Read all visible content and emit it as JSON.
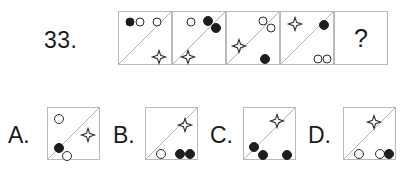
{
  "puzzle": {
    "question_number": "33.",
    "question_mark": "?",
    "type": "matrix-reasoning-sequence",
    "colors": {
      "box_border": "#b9b9b9",
      "diagonal": "#b0b0b0",
      "shape_outline": "#2b2b2b",
      "filled_shape": "#1d1d1d",
      "text": "#1a1a1a",
      "background": "#ffffff"
    },
    "sequence": {
      "box": {
        "left": 118,
        "top": 11,
        "size": 54,
        "count": 5
      },
      "cells": [
        {
          "name": "sequence-cell-1",
          "diagonal": "bottom-left-to-top-right",
          "shapes": [
            {
              "kind": "circle",
              "fill": "filled",
              "x": 11,
              "y": 10,
              "d": 9
            },
            {
              "kind": "circle",
              "fill": "open",
              "x": 21,
              "y": 10,
              "d": 9
            },
            {
              "kind": "circle",
              "fill": "open",
              "x": 38,
              "y": 10,
              "d": 9
            },
            {
              "kind": "star",
              "x": 40,
              "y": 45,
              "d": 13
            }
          ]
        },
        {
          "name": "sequence-cell-2",
          "diagonal": "bottom-left-to-top-right",
          "shapes": [
            {
              "kind": "circle",
              "fill": "open",
              "x": 18,
              "y": 10,
              "d": 9
            },
            {
              "kind": "circle",
              "fill": "filled",
              "x": 35,
              "y": 9,
              "d": 10
            },
            {
              "kind": "circle",
              "fill": "filled",
              "x": 43,
              "y": 16,
              "d": 10
            },
            {
              "kind": "star",
              "x": 15,
              "y": 45,
              "d": 13
            }
          ]
        },
        {
          "name": "sequence-cell-3",
          "diagonal": "bottom-left-to-top-right",
          "shapes": [
            {
              "kind": "circle",
              "fill": "open",
              "x": 36,
              "y": 9,
              "d": 9
            },
            {
              "kind": "circle",
              "fill": "open",
              "x": 44,
              "y": 16,
              "d": 9
            },
            {
              "kind": "star",
              "x": 12,
              "y": 34,
              "d": 13
            },
            {
              "kind": "circle",
              "fill": "filled",
              "x": 38,
              "y": 47,
              "d": 10
            }
          ]
        },
        {
          "name": "sequence-cell-4",
          "diagonal": "bottom-left-to-top-right",
          "shapes": [
            {
              "kind": "star",
              "x": 14,
              "y": 12,
              "d": 13
            },
            {
              "kind": "circle",
              "fill": "filled",
              "x": 43,
              "y": 13,
              "d": 10
            },
            {
              "kind": "circle",
              "fill": "open",
              "x": 37,
              "y": 47,
              "d": 9
            },
            {
              "kind": "circle",
              "fill": "open",
              "x": 46,
              "y": 47,
              "d": 9
            }
          ]
        },
        {
          "name": "sequence-cell-answer",
          "diagonal": "none",
          "is_answer_slot": true,
          "shapes": []
        }
      ]
    },
    "options": {
      "box": {
        "top": 107,
        "size": 53
      },
      "items": [
        {
          "name": "option-a",
          "label": "A.",
          "label_x": 8,
          "label_y": 124,
          "box_left": 47,
          "diagonal": "bottom-left-to-top-right",
          "shapes": [
            {
              "kind": "circle",
              "fill": "open",
              "x": 11,
              "y": 11,
              "d": 10
            },
            {
              "kind": "star",
              "x": 40,
              "y": 27,
              "d": 13
            },
            {
              "kind": "circle",
              "fill": "filled",
              "x": 11,
              "y": 40,
              "d": 10
            },
            {
              "kind": "circle",
              "fill": "open",
              "x": 19,
              "y": 48,
              "d": 10
            }
          ]
        },
        {
          "name": "option-b",
          "label": "B.",
          "label_x": 113,
          "label_y": 124,
          "box_left": 145,
          "diagonal": "bottom-left-to-top-right",
          "shapes": [
            {
              "kind": "star",
              "x": 39,
              "y": 17,
              "d": 13
            },
            {
              "kind": "circle",
              "fill": "open",
              "x": 15,
              "y": 46,
              "d": 10
            },
            {
              "kind": "circle",
              "fill": "filled",
              "x": 34,
              "y": 46,
              "d": 10
            },
            {
              "kind": "circle",
              "fill": "filled",
              "x": 44,
              "y": 46,
              "d": 10
            }
          ]
        },
        {
          "name": "option-c",
          "label": "C.",
          "label_x": 210,
          "label_y": 124,
          "box_left": 243,
          "diagonal": "bottom-left-to-top-right",
          "shapes": [
            {
              "kind": "star",
              "x": 33,
              "y": 13,
              "d": 13
            },
            {
              "kind": "circle",
              "fill": "filled",
              "x": 10,
              "y": 39,
              "d": 10
            },
            {
              "kind": "circle",
              "fill": "filled",
              "x": 19,
              "y": 47,
              "d": 10
            },
            {
              "kind": "circle",
              "fill": "filled",
              "x": 43,
              "y": 47,
              "d": 10
            }
          ]
        },
        {
          "name": "option-d",
          "label": "D.",
          "label_x": 308,
          "label_y": 124,
          "box_left": 343,
          "diagonal": "bottom-left-to-top-right",
          "shapes": [
            {
              "kind": "star",
              "x": 30,
              "y": 14,
              "d": 13
            },
            {
              "kind": "circle",
              "fill": "open",
              "x": 15,
              "y": 46,
              "d": 10
            },
            {
              "kind": "circle",
              "fill": "open",
              "x": 36,
              "y": 46,
              "d": 10
            },
            {
              "kind": "circle",
              "fill": "filled",
              "x": 45,
              "y": 46,
              "d": 10
            }
          ]
        }
      ]
    }
  }
}
